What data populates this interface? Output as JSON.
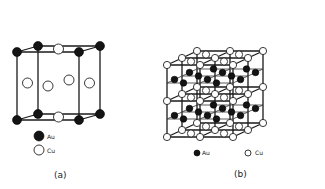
{
  "figure": {
    "panel_a": {
      "caption": "(a)",
      "legend": [
        {
          "symbol": "filled-circle",
          "label": "Au"
        },
        {
          "symbol": "open-circle",
          "label": "Cu"
        }
      ]
    },
    "panel_b": {
      "caption": "(b)",
      "legend": [
        {
          "symbol": "filled-circle",
          "label": "Au"
        },
        {
          "symbol": "open-circle",
          "label": "Cu"
        }
      ]
    },
    "colors": {
      "au": "#141414",
      "cu": "#ffffff",
      "lines": "#1a1a1a"
    }
  }
}
